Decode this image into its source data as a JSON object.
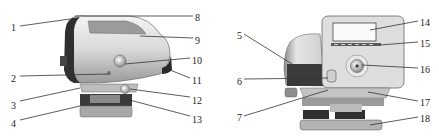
{
  "figure": {
    "left_view": {
      "name": "instrument-side-view",
      "labels": [
        {
          "id": "1",
          "text": "1",
          "x": 11,
          "y": 22,
          "line": [
            20,
            26,
            70,
            19
          ]
        },
        {
          "id": "2",
          "text": "2",
          "x": 11,
          "y": 73,
          "line": [
            20,
            76,
            109,
            74
          ]
        },
        {
          "id": "3",
          "text": "3",
          "x": 11,
          "y": 100,
          "line": [
            20,
            101,
            80,
            88
          ]
        },
        {
          "id": "4",
          "text": "4",
          "x": 11,
          "y": 118,
          "line": [
            20,
            120,
            80,
            106
          ]
        },
        {
          "id": "8",
          "text": "8",
          "x": 195,
          "y": 12,
          "line": [
            193,
            16,
            75,
            16
          ]
        },
        {
          "id": "9",
          "text": "9",
          "x": 195,
          "y": 35,
          "line": [
            193,
            38,
            140,
            36
          ]
        },
        {
          "id": "10",
          "text": "10",
          "x": 192,
          "y": 55,
          "line": [
            190,
            58,
            125,
            64
          ]
        },
        {
          "id": "11",
          "text": "11",
          "x": 192,
          "y": 75,
          "line": [
            190,
            78,
            170,
            70
          ]
        },
        {
          "id": "12",
          "text": "12",
          "x": 192,
          "y": 95,
          "line": [
            190,
            97,
            130,
            89
          ]
        },
        {
          "id": "13",
          "text": "13",
          "x": 192,
          "y": 114,
          "line": [
            190,
            116,
            122,
            98
          ]
        }
      ]
    },
    "right_view": {
      "name": "instrument-front-view",
      "labels": [
        {
          "id": "5",
          "text": "5",
          "x": 237,
          "y": 30,
          "line": [
            244,
            34,
            292,
            64
          ]
        },
        {
          "id": "6",
          "text": "6",
          "x": 237,
          "y": 76,
          "line": [
            244,
            79,
            328,
            78
          ]
        },
        {
          "id": "7",
          "text": "7",
          "x": 237,
          "y": 112,
          "line": [
            244,
            116,
            328,
            90
          ]
        },
        {
          "id": "14",
          "text": "14",
          "x": 420,
          "y": 17,
          "line": [
            418,
            21,
            370,
            30
          ]
        },
        {
          "id": "15",
          "text": "15",
          "x": 420,
          "y": 38,
          "line": [
            418,
            42,
            380,
            45
          ]
        },
        {
          "id": "16",
          "text": "16",
          "x": 420,
          "y": 64,
          "line": [
            418,
            68,
            362,
            65
          ]
        },
        {
          "id": "17",
          "text": "17",
          "x": 420,
          "y": 97,
          "line": [
            418,
            101,
            368,
            92
          ]
        },
        {
          "id": "18",
          "text": "18",
          "x": 420,
          "y": 113,
          "line": [
            418,
            117,
            370,
            125
          ]
        }
      ]
    }
  },
  "colors": {
    "line": "#333333",
    "text": "#222222",
    "body_light": "#e8e8e8",
    "body_mid": "#bdbdbd",
    "body_dark": "#3a3a3a",
    "background": "#ffffff"
  }
}
